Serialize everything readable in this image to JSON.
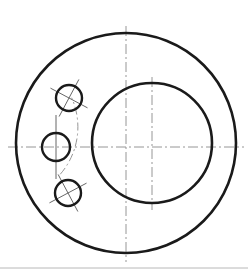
{
  "drawing": {
    "type": "engineering-orthographic-view",
    "title": "Flanged disc front view",
    "background_color": "#ffffff",
    "outline_color": "#1a1a1a",
    "centerline_color": "#8a8a8a",
    "outline_width": 2.6,
    "thin_width": 0.9,
    "centerline_width": 0.9,
    "centerline_dash": "10 3 2 3",
    "view_box": "0 0 248 276",
    "outer_circle": {
      "name": "outer-flange-circle",
      "cx": 126,
      "cy": 143,
      "r": 110,
      "stroke": "#1a1a1a",
      "stroke_width": 2.6
    },
    "inner_bore": {
      "name": "central-bore-circle",
      "cx": 152,
      "cy": 143,
      "r": 60,
      "stroke": "#1a1a1a",
      "stroke_width": 2.6
    },
    "bolt_holes": [
      {
        "name": "bolt-hole-top",
        "cx": 69,
        "cy": 98,
        "r": 13,
        "cross_angle_deg": 28,
        "cross_overhang": 8
      },
      {
        "name": "bolt-hole-middle",
        "cx": 56,
        "cy": 147,
        "r": 14,
        "cross_angle_deg": 0,
        "cross_overhang": 18
      },
      {
        "name": "bolt-hole-bottom",
        "cx": 68,
        "cy": 193,
        "r": 13,
        "cross_angle_deg": -28,
        "cross_overhang": 8
      }
    ],
    "bolt_circle": {
      "name": "bolt-circle-arc",
      "cx": 126,
      "cy": 145,
      "r": 72,
      "start_angle_deg": 156,
      "end_angle_deg": 221
    },
    "centerlines": {
      "horizontal_main": {
        "name": "horizontal-centerline",
        "x1": 8,
        "y1": 147,
        "x2": 244,
        "y2": 147
      },
      "vertical_outer": {
        "name": "vertical-centerline-outer",
        "x1": 126,
        "y1": 26,
        "x2": 126,
        "y2": 262
      },
      "vertical_bore": {
        "name": "vertical-centerline-bore",
        "x1": 152,
        "y1": 77,
        "x2": 152,
        "y2": 210
      }
    },
    "sheet_rule": {
      "name": "sheet-border-rule",
      "y": 268,
      "color": "#b8b8b8"
    }
  }
}
